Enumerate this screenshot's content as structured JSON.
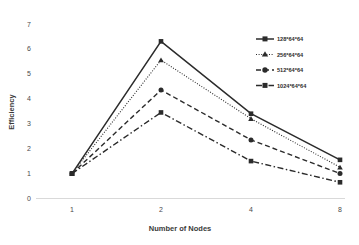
{
  "chart_data": {
    "type": "line",
    "title": "",
    "xlabel": "Number of Nodes",
    "ylabel": "Efficiency",
    "x": [
      1,
      2,
      4,
      8
    ],
    "xtick_labels": [
      "1",
      "2",
      "4",
      "8"
    ],
    "ytick_labels": [
      "0",
      "1",
      "2",
      "3",
      "4",
      "5",
      "6",
      "7"
    ],
    "ylim": [
      0,
      7
    ],
    "grid": false,
    "legend_position": "upper-right",
    "series": [
      {
        "name": "128*64*64",
        "values": [
          1.0,
          6.3,
          3.4,
          1.55
        ],
        "line_style": "solid",
        "marker": "square",
        "color": "#2b2b2b"
      },
      {
        "name": "256*64*64",
        "values": [
          1.0,
          5.55,
          3.2,
          1.25
        ],
        "line_style": "dotted",
        "marker": "triangle",
        "color": "#2b2b2b"
      },
      {
        "name": "512*64*64",
        "values": [
          1.0,
          4.35,
          2.35,
          1.0
        ],
        "line_style": "dashed",
        "marker": "circle",
        "color": "#2b2b2b"
      },
      {
        "name": "1024*64*64",
        "values": [
          1.0,
          3.45,
          1.5,
          0.65
        ],
        "line_style": "dashdot",
        "marker": "square",
        "color": "#2b2b2b"
      }
    ]
  },
  "axes": {
    "y_title": "Efficiency",
    "x_title": "Number of Nodes"
  },
  "ticks": {
    "y": [
      "7",
      "6",
      "5",
      "4",
      "3",
      "2",
      "1",
      "0"
    ],
    "x": [
      "1",
      "2",
      "4",
      "8"
    ]
  },
  "legend": {
    "items": [
      {
        "label": "128*64*64"
      },
      {
        "label": "256*64*64"
      },
      {
        "label": "512*64*64"
      },
      {
        "label": "1024*64*64"
      }
    ]
  },
  "colors": {
    "line": "#2b2b2b",
    "baseline": "#d7d7d7",
    "text": "#3a3a3a"
  }
}
